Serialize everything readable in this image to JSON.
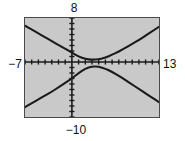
{
  "figure": {
    "kind": "graphing-calculator-window",
    "background_color": "#ffffff",
    "plot_background_color": "#c9c9c9",
    "frame_color": "#4a4a4a",
    "curve_color": "#1a1a1a"
  },
  "labels": {
    "xmin": "−7",
    "xmax": "13",
    "ymax": "8",
    "ymin": "−10"
  },
  "chart_data": {
    "type": "line",
    "title": "",
    "xlabel": "",
    "ylabel": "",
    "xlim": [
      -7,
      13
    ],
    "ylim": [
      -10,
      8
    ],
    "grid": false,
    "legend": "none",
    "axes": {
      "x_axis_at_y": 0,
      "y_axis_at_x": 0,
      "tick_spacing_x": 1,
      "tick_spacing_y": 1,
      "ticks_style": "hash-marks-on-axes"
    },
    "tick_labels": {
      "x": [
        "−7",
        "13"
      ],
      "y": [
        "−10",
        "8"
      ]
    },
    "annotations": [
      {
        "text": "8",
        "position": "top",
        "meaning": "Ymax"
      },
      {
        "text": "−10",
        "position": "bottom",
        "meaning": "Ymin"
      },
      {
        "text": "−7",
        "position": "left",
        "meaning": "Xmin"
      },
      {
        "text": "13",
        "position": "right",
        "meaning": "Xmax"
      }
    ],
    "series": [
      {
        "name": "upper branch",
        "description": "Hyperbola branch opening upward with vertex near (3, 0.4); decreasing from upper-left, minimum near center, then increasing to upper-right.",
        "x": [
          -7.0,
          -6.0,
          -5.0,
          -4.0,
          -3.0,
          -2.0,
          -1.0,
          0.0,
          1.0,
          2.0,
          3.0,
          4.0,
          5.0,
          6.0,
          7.0,
          8.0,
          9.0,
          10.0,
          11.0,
          12.0,
          13.0
        ],
        "y": [
          6.6,
          5.9,
          5.2,
          4.5,
          3.8,
          3.1,
          2.4,
          1.7,
          1.0,
          0.55,
          0.4,
          0.5,
          0.8,
          1.3,
          1.9,
          2.6,
          3.3,
          4.0,
          4.8,
          5.6,
          6.4
        ]
      },
      {
        "name": "lower branch",
        "description": "Hyperbola branch opening downward with vertex near (3, -0.8); increasing from lower-left, maximum near center, then decreasing to lower-right.",
        "x": [
          -7.0,
          -6.0,
          -5.0,
          -4.0,
          -3.0,
          -2.0,
          -1.0,
          0.0,
          1.0,
          2.0,
          3.0,
          4.0,
          5.0,
          6.0,
          7.0,
          8.0,
          9.0,
          10.0,
          11.0,
          12.0,
          13.0
        ],
        "y": [
          -8.2,
          -7.5,
          -6.8,
          -6.1,
          -5.4,
          -4.6,
          -3.8,
          -3.0,
          -2.0,
          -1.2,
          -0.8,
          -0.85,
          -1.2,
          -1.8,
          -2.5,
          -3.3,
          -4.1,
          -4.9,
          -5.7,
          -6.5,
          -7.3
        ]
      }
    ]
  }
}
